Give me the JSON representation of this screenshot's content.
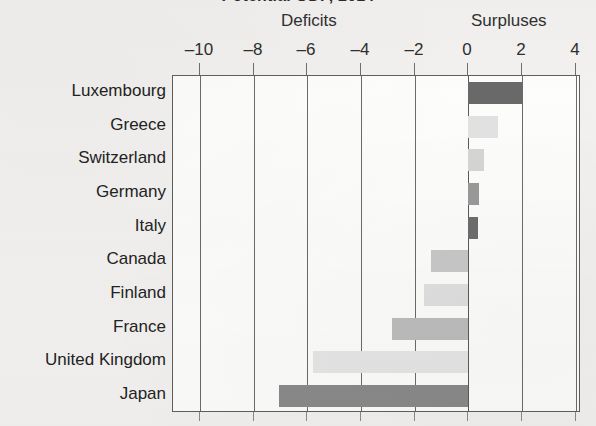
{
  "chart_data": {
    "type": "bar",
    "orientation": "horizontal",
    "title": "Potential GDP, 2014",
    "xlabel": "",
    "ylabel": "",
    "xlim": [
      -11,
      4.2
    ],
    "grid": true,
    "legend_position": "none",
    "section_labels": {
      "negative": "Deficits",
      "positive": "Surpluses"
    },
    "xticks": [
      -10,
      -8,
      -6,
      -4,
      -2,
      0,
      2,
      4
    ],
    "xtick_labels": [
      "–10",
      "–8",
      "–6",
      "–4",
      "–2",
      "0",
      "2",
      "4"
    ],
    "categories": [
      "Luxembourg",
      "Greece",
      "Switzerland",
      "Germany",
      "Italy",
      "Canada",
      "Finland",
      "France",
      "United Kingdom",
      "Japan"
    ],
    "values": [
      2.0,
      1.1,
      0.6,
      0.4,
      0.35,
      -1.4,
      -1.65,
      -2.85,
      -5.8,
      -7.05
    ],
    "bar_colors": [
      "#696969",
      "#e2e2e2",
      "#d6d6d6",
      "#9a9a9a",
      "#6d6d6d",
      "#c9c9c9",
      "#e0e0e0",
      "#bdbdbd",
      "#e6e6e6",
      "#8a8a8a"
    ]
  },
  "colors": {
    "page_background": "#f2f1ef",
    "plot_background": "#fdfdfc",
    "axis": "#5f5f5f",
    "gridline": "#6b6b6b",
    "text": "#232323"
  }
}
